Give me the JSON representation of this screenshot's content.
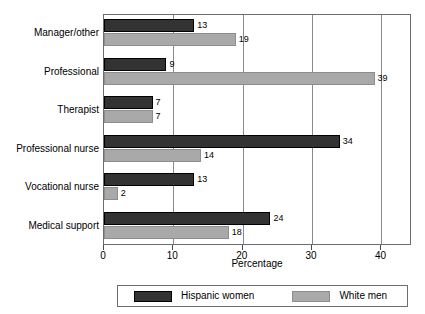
{
  "chart_data": {
    "type": "bar",
    "orientation": "horizontal",
    "title": "",
    "xlabel": "Percentage",
    "ylabel": "",
    "xlim": [
      0,
      44.4
    ],
    "xticks": [
      0,
      10,
      20,
      30,
      40
    ],
    "xticklabels": [
      "0",
      "10",
      "20",
      "30",
      "40"
    ],
    "grid": true,
    "grid_axis": "x",
    "legend_position": "bottom",
    "categories": [
      "Manager/other",
      "Professional",
      "Therapist",
      "Professional nurse",
      "Vocational nurse",
      "Medical support"
    ],
    "series": [
      {
        "name": "Hispanic women",
        "color": "#333333",
        "values": [
          13,
          9,
          7,
          34,
          13,
          24
        ],
        "labels": [
          "13",
          "9",
          "7",
          "34",
          "13",
          "24"
        ]
      },
      {
        "name": "White men",
        "color": "#a9a9a9",
        "values": [
          19,
          39,
          7,
          14,
          2,
          18
        ],
        "labels": [
          "19",
          "39",
          "7",
          "14",
          "2",
          "18"
        ]
      }
    ]
  },
  "legend": {
    "entries": [
      {
        "label": "Hispanic women"
      },
      {
        "label": "White men"
      }
    ]
  }
}
